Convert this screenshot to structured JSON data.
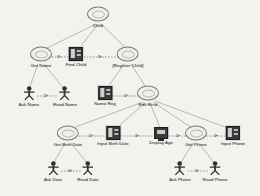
{
  "diagram": {
    "type": "use-case-task-tree",
    "background_color": "#f2f2ef",
    "line_color": "#8a8a8a",
    "icon_dark_color": "#3b3b3b",
    "nodes": [
      {
        "id": "child",
        "label": "Child",
        "icon": "use-case-oval-icon",
        "x": 98,
        "y": 17
      },
      {
        "id": "get-name",
        "label": "Get Name",
        "icon": "use-case-oval-icon",
        "x": 41,
        "y": 57
      },
      {
        "id": "find-child",
        "label": "Find Child",
        "icon": "form-window-icon",
        "x": 76,
        "y": 57
      },
      {
        "id": "register-child",
        "label": "[Register Child]",
        "icon": "use-case-oval-icon",
        "x": 128,
        "y": 57
      },
      {
        "id": "ask-name",
        "label": "Ask Name",
        "icon": "actor-icon",
        "x": 29,
        "y": 96
      },
      {
        "id": "read-name",
        "label": "Read Name",
        "icon": "actor-icon",
        "x": 65,
        "y": 96
      },
      {
        "id": "name-reg",
        "label": "Name Reg",
        "icon": "form-window-icon",
        "x": 105,
        "y": 96
      },
      {
        "id": "edit-rcrd",
        "label": "Edit Rcrd",
        "icon": "use-case-oval-icon",
        "x": 148,
        "y": 96
      },
      {
        "id": "get-birth-date",
        "label": "Get Birth Date",
        "icon": "use-case-oval-icon",
        "x": 68,
        "y": 136
      },
      {
        "id": "input-birth-date",
        "label": "Input Birth Date",
        "icon": "form-window-icon",
        "x": 113,
        "y": 136
      },
      {
        "id": "display-age",
        "label": "Display Age",
        "icon": "monitor-icon",
        "x": 161,
        "y": 136
      },
      {
        "id": "get-phone",
        "label": "Get Phone",
        "icon": "use-case-oval-icon",
        "x": 196,
        "y": 136
      },
      {
        "id": "input-phone",
        "label": "Input Phone",
        "icon": "form-window-icon",
        "x": 233,
        "y": 136
      },
      {
        "id": "ask-date",
        "label": "Ask Date",
        "icon": "actor-icon",
        "x": 53,
        "y": 171
      },
      {
        "id": "read-date",
        "label": "Read Date",
        "icon": "actor-icon",
        "x": 88,
        "y": 171
      },
      {
        "id": "ask-phone",
        "label": "Ask Phone",
        "icon": "actor-icon",
        "x": 180,
        "y": 171
      },
      {
        "id": "read-phone",
        "label": "Read Phone",
        "icon": "actor-icon",
        "x": 215,
        "y": 171
      }
    ],
    "tree_edges": [
      {
        "from": "child",
        "to": "get-name"
      },
      {
        "from": "child",
        "to": "find-child"
      },
      {
        "from": "child",
        "to": "register-child"
      },
      {
        "from": "get-name",
        "to": "ask-name"
      },
      {
        "from": "get-name",
        "to": "read-name"
      },
      {
        "from": "register-child",
        "to": "name-reg"
      },
      {
        "from": "register-child",
        "to": "edit-rcrd"
      },
      {
        "from": "edit-rcrd",
        "to": "get-birth-date"
      },
      {
        "from": "edit-rcrd",
        "to": "input-birth-date"
      },
      {
        "from": "edit-rcrd",
        "to": "display-age"
      },
      {
        "from": "edit-rcrd",
        "to": "get-phone"
      },
      {
        "from": "edit-rcrd",
        "to": "input-phone"
      },
      {
        "from": "get-birth-date",
        "to": "ask-date"
      },
      {
        "from": "get-birth-date",
        "to": "read-date"
      },
      {
        "from": "get-phone",
        "to": "ask-phone"
      },
      {
        "from": "get-phone",
        "to": "read-phone"
      }
    ],
    "sequence_links": [
      {
        "from": "get-name",
        "to": "find-child",
        "style": "dashed-arrow"
      },
      {
        "from": "find-child",
        "to": "register-child",
        "style": "dashed-arrow"
      },
      {
        "from": "ask-name",
        "to": "read-name",
        "style": "dashed-arrow"
      },
      {
        "from": "name-reg",
        "to": "edit-rcrd",
        "style": "dashed-arrow"
      },
      {
        "from": "get-birth-date",
        "to": "input-birth-date",
        "style": "dashed-arrow"
      },
      {
        "from": "input-birth-date",
        "to": "display-age",
        "style": "dashed-arrow"
      },
      {
        "from": "display-age",
        "to": "get-phone",
        "style": "dashed-arrow"
      },
      {
        "from": "get-phone",
        "to": "input-phone",
        "style": "dashed-arrow"
      },
      {
        "from": "ask-date",
        "to": "read-date",
        "style": "dashed-arrow"
      },
      {
        "from": "ask-phone",
        "to": "read-phone",
        "style": "dashed-arrow"
      }
    ]
  }
}
